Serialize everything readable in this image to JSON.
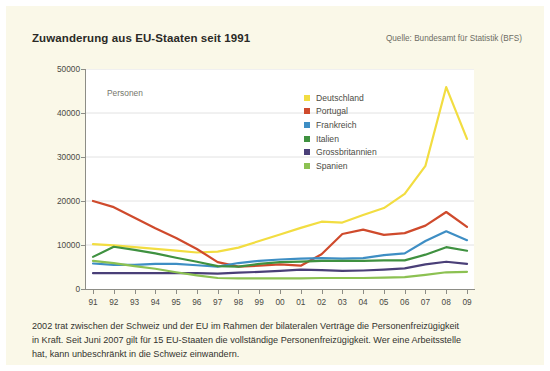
{
  "header": {
    "title": "Zuwanderung aus EU-Staaten seit 1991",
    "source": "Quelle: Bundesamt für Statistik (BFS)"
  },
  "caption": {
    "line1": "2002 trat zwischen der Schweiz und der EU im Rahmen der bilateralen Verträge die Personenfreizügigkeit",
    "line2": "in Kraft. Seit Juni 2007 gilt für 15 EU-Staaten die vollständige Personenfreizügigkeit. Wer eine Arbeitsstelle",
    "line3": "hat, kann unbeschränkt in die Schweiz einwandern."
  },
  "colors": {
    "page_background": "#faf8e8",
    "plot_background": "#ffffff",
    "axis": "#8d8d86",
    "gridline": "#e2e2e2",
    "deutschland": "#f2dd41",
    "portugal": "#cf4a2c",
    "frankreich": "#3e8ec4",
    "italien": "#3f9140",
    "grossbritannien": "#4a3f78",
    "spanien": "#8cc152"
  },
  "chart_data": {
    "type": "line",
    "title": "Zuwanderung aus EU-Staaten seit 1991",
    "xlabel": "",
    "ylabel": "Personen",
    "ylim": [
      0,
      50000
    ],
    "ytick_labels": [
      "50000",
      "40000",
      "30000",
      "20000",
      "10000",
      "0"
    ],
    "ytick_values": [
      50000,
      40000,
      30000,
      20000,
      10000,
      0
    ],
    "grid": true,
    "legend_position": "inside-top-center",
    "categories": [
      "91",
      "92",
      "93",
      "94",
      "95",
      "96",
      "97",
      "98",
      "99",
      "00",
      "01",
      "02",
      "03",
      "04",
      "05",
      "06",
      "07",
      "08",
      "09"
    ],
    "series": [
      {
        "name": "Deutschland",
        "color": "#f2dd41",
        "values": [
          10200,
          9900,
          9500,
          9100,
          8700,
          8300,
          8500,
          9400,
          10900,
          12400,
          13900,
          15300,
          15100,
          16800,
          18400,
          21600,
          28000,
          45900,
          34100
        ]
      },
      {
        "name": "Portugal",
        "color": "#cf4a2c",
        "values": [
          20000,
          18600,
          16200,
          13800,
          11600,
          9100,
          6100,
          5100,
          5300,
          5600,
          5300,
          7900,
          12500,
          13500,
          12300,
          12700,
          14400,
          17500,
          14100
        ]
      },
      {
        "name": "Frankreich",
        "color": "#3e8ec4",
        "values": [
          5800,
          5500,
          5500,
          5700,
          5700,
          5400,
          5100,
          5900,
          6400,
          6700,
          6900,
          7000,
          6900,
          7000,
          7700,
          8100,
          10900,
          13100,
          11100
        ]
      },
      {
        "name": "Italien",
        "color": "#3f9140",
        "values": [
          7300,
          9600,
          8900,
          8100,
          7100,
          6200,
          5200,
          5100,
          5700,
          6100,
          6200,
          6400,
          6400,
          6400,
          6500,
          6500,
          7800,
          9500,
          8700
        ]
      },
      {
        "name": "Grossbritannien",
        "color": "#4a3f78",
        "values": [
          3600,
          3600,
          3600,
          3600,
          3600,
          3600,
          3500,
          3700,
          3900,
          4100,
          4400,
          4300,
          4100,
          4200,
          4400,
          4700,
          5600,
          6200,
          5700
        ]
      },
      {
        "name": "Spanien",
        "color": "#8cc152",
        "values": [
          6400,
          5900,
          5200,
          4600,
          3800,
          3100,
          2500,
          2400,
          2400,
          2400,
          2400,
          2500,
          2500,
          2500,
          2600,
          2700,
          3200,
          3800,
          3900
        ]
      }
    ]
  }
}
